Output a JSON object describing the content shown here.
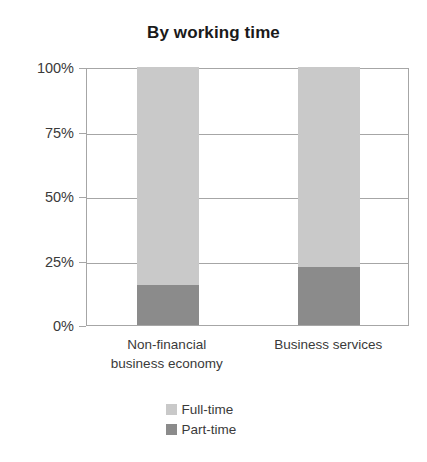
{
  "chart_data": {
    "type": "bar",
    "subtype": "stacked-bar-100-percent",
    "title": "By working time",
    "xlabel": "",
    "ylabel": "",
    "ylim": [
      0,
      100
    ],
    "ytick_labels": [
      "0%",
      "25%",
      "50%",
      "75%",
      "100%"
    ],
    "ytick_values": [
      0,
      25,
      50,
      75,
      100
    ],
    "grid": true,
    "legend_position": "bottom",
    "categories": [
      "Non-financial business economy",
      "Business services"
    ],
    "category_lines": [
      [
        "Non-financial",
        "business economy"
      ],
      [
        "Business services"
      ]
    ],
    "series": [
      {
        "name": "Full-time",
        "values": [
          84.5,
          77.5
        ],
        "color": "#c9c9c9"
      },
      {
        "name": "Part-time",
        "values": [
          15.5,
          22.5
        ],
        "color": "#8b8b8b"
      }
    ],
    "stack_order_bottom_to_top": [
      "Part-time",
      "Full-time"
    ],
    "colors": {
      "full_time": "#c9c9c9",
      "part_time": "#8b8b8b",
      "axis": "#a6a6a6",
      "text": "#3a3a3a",
      "title": "#1a1a1a",
      "background": "#ffffff"
    }
  }
}
